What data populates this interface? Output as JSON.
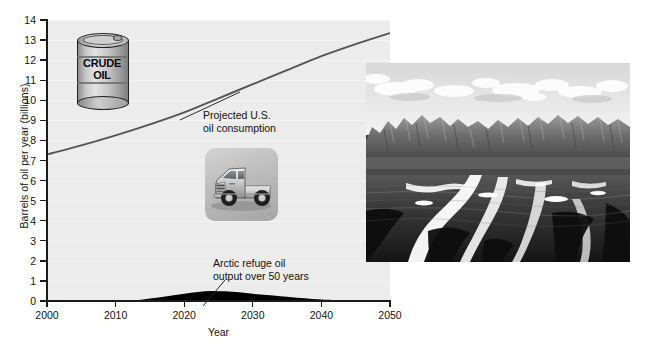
{
  "chart_data": {
    "type": "line",
    "title": "",
    "xlabel": "Year",
    "ylabel": "Barrels of oil per year (billions)",
    "xlim": [
      2000,
      2050
    ],
    "ylim": [
      0,
      14
    ],
    "grid": true,
    "legend_position": "inline-annotations",
    "xticks": [
      "2000",
      "2010",
      "2020",
      "2030",
      "2040",
      "2050"
    ],
    "yticks": [
      "0",
      "1",
      "2",
      "3",
      "4",
      "5",
      "6",
      "7",
      "8",
      "9",
      "10",
      "11",
      "12",
      "13",
      "14"
    ],
    "series": [
      {
        "name": "Projected U.S. oil consumption",
        "render": "line",
        "x": [
          2000,
          2005,
          2010,
          2015,
          2020,
          2025,
          2030,
          2035,
          2040,
          2045,
          2050
        ],
        "values": [
          7.3,
          7.75,
          8.25,
          8.8,
          9.4,
          10.1,
          10.8,
          11.5,
          12.2,
          12.8,
          13.35
        ]
      },
      {
        "name": "Arctic refuge oil output over 50 years",
        "render": "area",
        "x": [
          2000,
          2010,
          2012,
          2014,
          2016,
          2018,
          2020,
          2022,
          2024,
          2026,
          2028,
          2030,
          2032,
          2034,
          2036,
          2038,
          2040,
          2045,
          2050
        ],
        "values": [
          0,
          0,
          0.02,
          0.08,
          0.16,
          0.26,
          0.36,
          0.45,
          0.5,
          0.48,
          0.43,
          0.36,
          0.3,
          0.24,
          0.18,
          0.12,
          0.07,
          0.01,
          0
        ]
      }
    ]
  },
  "annotations": {
    "consumption": {
      "line1": "Projected U.S.",
      "line2": "oil consumption"
    },
    "arctic": {
      "line1": "Arctic refuge oil",
      "line2": "output over 50 years"
    }
  },
  "drum": {
    "line1": "CRUDE",
    "line2": "OIL"
  },
  "photo": {
    "credit": "Chuck Young/U.S. Fish and Wildlife Service",
    "alt": "Arctic National Wildlife Refuge coastal plain with mountain range"
  },
  "colors": {
    "plot_background": "#ececec",
    "axis": "#1a1a1a",
    "consumption_line": "#555555",
    "arctic_area": "#000000",
    "page_background": "#ffffff"
  }
}
